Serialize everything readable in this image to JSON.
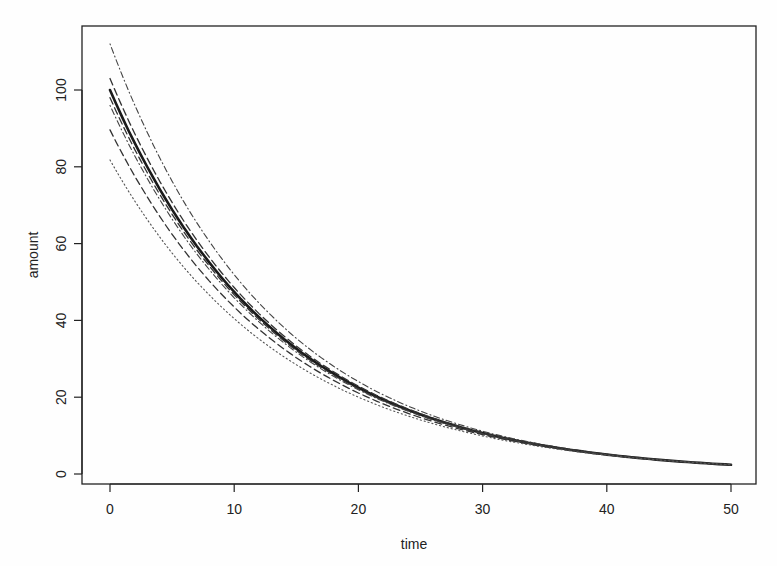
{
  "chart_data": {
    "type": "line",
    "title": "",
    "xlabel": "time",
    "ylabel": "amount",
    "xlim": [
      -2,
      52
    ],
    "ylim": [
      -3,
      119
    ],
    "x_ticks": [
      0,
      10,
      20,
      30,
      40,
      50
    ],
    "y_ticks": [
      0,
      20,
      40,
      60,
      80,
      100
    ],
    "grid": false,
    "legend": null,
    "model": "amount = A0 * exp(-k * time)",
    "series": [
      {
        "name": "fit",
        "style": "solid-thick",
        "A0": 100,
        "k": 0.0746
      },
      {
        "name": "upper-outer",
        "style": "dotdash",
        "A0": 112,
        "k": 0.0769
      },
      {
        "name": "upper-inner",
        "style": "dashed",
        "A0": 103,
        "k": 0.0752
      },
      {
        "name": "mid-1",
        "style": "dashed",
        "A0": 98,
        "k": 0.0742
      },
      {
        "name": "mid-2",
        "style": "dotdash",
        "A0": 96,
        "k": 0.0738
      },
      {
        "name": "lower-inner",
        "style": "dashed",
        "A0": 89.6,
        "k": 0.0723
      },
      {
        "name": "lower-outer",
        "style": "dotted",
        "A0": 81.8,
        "k": 0.0704
      }
    ],
    "x": [
      0,
      5,
      10,
      15,
      20,
      25,
      30,
      35,
      40,
      45,
      50
    ],
    "fit_values": [
      100,
      68.9,
      47.4,
      32.7,
      22.5,
      15.5,
      10.7,
      7.3,
      5.1,
      3.5,
      2.4
    ]
  }
}
